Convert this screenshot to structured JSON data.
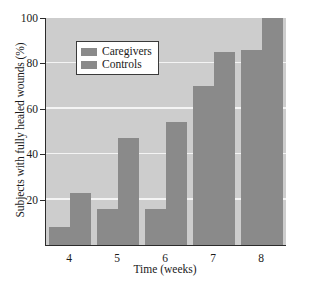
{
  "chart_data": {
    "type": "bar",
    "title": "",
    "xlabel": "Time (weeks)",
    "ylabel": "Subjects with fully healed wounds (%)",
    "categories": [
      "4",
      "5",
      "6",
      "7",
      "8"
    ],
    "series": [
      {
        "name": "Caregivers",
        "values": [
          8,
          16,
          16,
          70,
          86
        ],
        "color": "#8a8a8a"
      },
      {
        "name": "Controls",
        "values": [
          23,
          47,
          54,
          85,
          100
        ],
        "color": "#8a8a8a"
      }
    ],
    "ylim": [
      0,
      100
    ],
    "yticks": [
      0,
      20,
      40,
      60,
      80,
      100
    ],
    "ytick_labels": [
      "",
      "20",
      "40",
      "60",
      "80",
      "100"
    ],
    "grid": true,
    "gridlines_at": [
      20,
      40,
      60,
      80
    ],
    "legend_position": "upper-left-inset",
    "plot_background": "#cdcdcd",
    "gridline_color": "#f4f4f4",
    "axis_color": "#2b2b2b",
    "figure_background": "#ffffff"
  }
}
